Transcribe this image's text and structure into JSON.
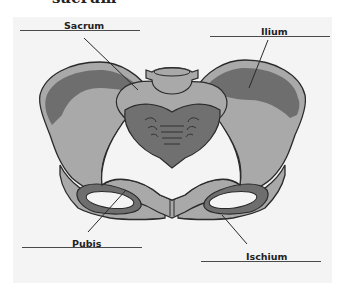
{
  "title": {
    "text": "sacrum"
  },
  "diagram": {
    "labels": [
      {
        "id": "sacrum",
        "text": "Sacrum"
      },
      {
        "id": "ilium",
        "text": "Ilium"
      },
      {
        "id": "pubis",
        "text": "Pubis"
      },
      {
        "id": "ischium",
        "text": "Ischium"
      }
    ],
    "colors": {
      "panel": "#f4f4f4",
      "bone_light": "#a9a9a9",
      "bone_dark": "#6e6e6e",
      "outline": "#2a2a2a",
      "sacrum": "#707070"
    }
  }
}
